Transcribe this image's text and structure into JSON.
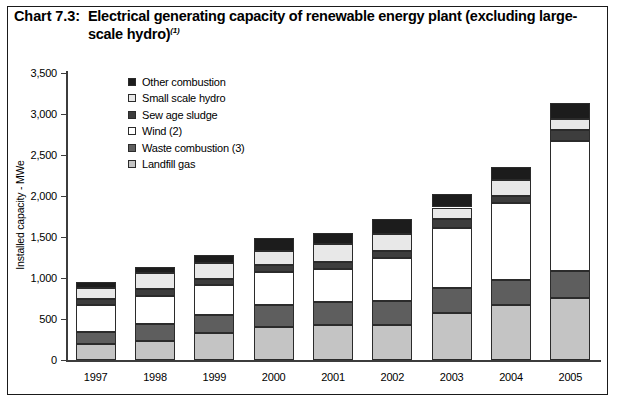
{
  "title": {
    "number": "Chart 7.3:",
    "text": "Electrical generating capacity of renewable energy plant (excluding large-scale hydro)",
    "superscript": "(1)"
  },
  "legend": {
    "position": "inside-top-left",
    "items": [
      {
        "label": "Other combustion",
        "color": "#1c1c1c"
      },
      {
        "label": "Small scale hydro",
        "color": "#e8e8e8"
      },
      {
        "label": "Sew age sludge",
        "color": "#3d3d3d"
      },
      {
        "label": "Wind (2)",
        "color": "#ffffff"
      },
      {
        "label": "Waste combustion (3)",
        "color": "#5e5e5e"
      },
      {
        "label": "Landfill gas",
        "color": "#c4c4c4"
      }
    ]
  },
  "chart_data": {
    "type": "bar",
    "stacked": true,
    "title": "Electrical generating capacity of renewable energy plant (excluding large-scale hydro)",
    "xlabel": "",
    "ylabel": "Installed capacity - MWe",
    "ylim": [
      0,
      3500
    ],
    "ytick_step": 500,
    "ytick_labels": [
      "0",
      "500",
      "1,000",
      "1,500",
      "2,000",
      "2,500",
      "3,000",
      "3,500"
    ],
    "grid": false,
    "categories": [
      "1997",
      "1998",
      "1999",
      "2000",
      "2001",
      "2002",
      "2003",
      "2004",
      "2005"
    ],
    "series": [
      {
        "name": "Landfill gas",
        "color": "#c4c4c4",
        "values": [
          190,
          230,
          325,
          400,
          425,
          430,
          575,
          670,
          760
        ]
      },
      {
        "name": "Waste combustion (3)",
        "color": "#5e5e5e",
        "values": [
          150,
          215,
          230,
          265,
          280,
          290,
          300,
          305,
          320
        ]
      },
      {
        "name": "Wind (2)",
        "color": "#ffffff",
        "values": [
          330,
          330,
          365,
          405,
          410,
          530,
          740,
          945,
          1585
        ]
      },
      {
        "name": "Sew age sludge",
        "color": "#3d3d3d",
        "values": [
          80,
          85,
          70,
          85,
          80,
          85,
          110,
          85,
          135
        ]
      },
      {
        "name": "Small scale hydro",
        "color": "#e8e8e8",
        "values": [
          130,
          200,
          195,
          175,
          215,
          205,
          135,
          190,
          145
        ]
      },
      {
        "name": "Other combustion",
        "color": "#1c1c1c",
        "values": [
          70,
          75,
          100,
          160,
          145,
          185,
          165,
          165,
          185
        ]
      }
    ],
    "totals": [
      950,
      1135,
      1285,
      1490,
      1555,
      1725,
      2025,
      2360,
      3130
    ]
  }
}
